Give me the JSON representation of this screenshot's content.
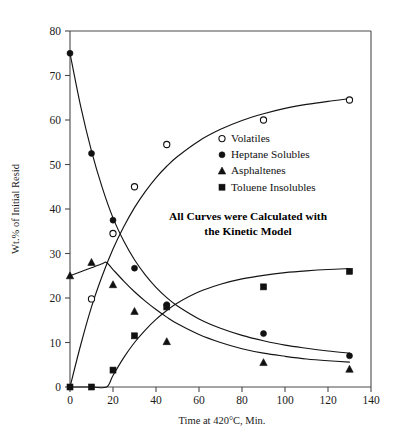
{
  "chart_data": {
    "type": "scatter",
    "title": "",
    "subtitle": "",
    "xlabel": "Time at 420°C, Min.",
    "ylabel": "Wt.% of Initial Resid",
    "xlim": [
      0,
      140
    ],
    "ylim": [
      0,
      80
    ],
    "xticks": [
      0,
      20,
      40,
      60,
      80,
      100,
      120,
      140
    ],
    "yticks": [
      0,
      10,
      20,
      30,
      40,
      50,
      60,
      70,
      80
    ],
    "grid": false,
    "legend_position": "upper-right-inside",
    "annotations": [
      {
        "line1": "All Curves were Calculated with",
        "line2": "the Kinetic Model"
      }
    ],
    "series": [
      {
        "name": "Volatiles",
        "marker": "open-circle",
        "x": [
          10,
          20,
          30,
          45,
          90,
          130
        ],
        "y": [
          19.8,
          34.5,
          45.0,
          54.5,
          60.0,
          64.5
        ],
        "fit_curve": {
          "x": [
            0,
            5,
            10,
            15,
            20,
            25,
            30,
            35,
            40,
            45,
            50,
            60,
            70,
            80,
            90,
            100,
            110,
            120,
            130
          ],
          "y": [
            0.0,
            9.5,
            18.0,
            25.0,
            31.0,
            36.0,
            40.3,
            43.9,
            47.0,
            49.6,
            51.8,
            55.3,
            57.9,
            59.9,
            61.4,
            62.6,
            63.5,
            64.2,
            64.8
          ]
        }
      },
      {
        "name": "Heptane Solubles",
        "marker": "filled-circle",
        "x": [
          0,
          10,
          20,
          30,
          45,
          90,
          130
        ],
        "y": [
          75.0,
          52.5,
          37.5,
          26.7,
          18.5,
          12.0,
          7.0
        ],
        "fit_curve": {
          "x": [
            0,
            5,
            10,
            15,
            20,
            25,
            30,
            35,
            40,
            45,
            50,
            60,
            70,
            80,
            90,
            100,
            110,
            120,
            130
          ],
          "y": [
            75.0,
            63.0,
            53.0,
            44.8,
            38.0,
            32.8,
            28.6,
            25.2,
            22.4,
            20.1,
            18.2,
            15.3,
            13.2,
            11.6,
            10.4,
            9.4,
            8.7,
            8.1,
            7.6
          ]
        }
      },
      {
        "name": "Asphaltenes",
        "marker": "filled-triangle",
        "x": [
          0,
          10,
          20,
          30,
          45,
          90,
          130
        ],
        "y": [
          25.0,
          28.0,
          23.0,
          17.0,
          10.2,
          5.5,
          4.0
        ],
        "fit_curve": {
          "x": [
            0,
            5,
            10,
            15,
            17,
            20,
            25,
            30,
            35,
            40,
            45,
            50,
            60,
            70,
            80,
            90,
            100,
            110,
            120,
            130
          ],
          "y": [
            25.0,
            25.9,
            26.8,
            27.7,
            28.0,
            26.4,
            23.8,
            21.4,
            19.3,
            17.4,
            15.7,
            14.2,
            11.8,
            10.0,
            8.6,
            7.6,
            6.9,
            6.3,
            5.9,
            5.6
          ]
        }
      },
      {
        "name": "Toluene Insolubles",
        "marker": "filled-square",
        "x": [
          0,
          10,
          20,
          30,
          45,
          90,
          130
        ],
        "y": [
          0.0,
          0.0,
          3.8,
          11.5,
          18.0,
          22.5,
          26.0
        ],
        "fit_curve": {
          "x": [
            0,
            10,
            17,
            20,
            25,
            30,
            35,
            40,
            45,
            50,
            60,
            70,
            80,
            90,
            100,
            110,
            120,
            130
          ],
          "y": [
            0.0,
            0.0,
            0.0,
            2.6,
            6.6,
            10.0,
            12.8,
            15.2,
            17.2,
            18.9,
            21.4,
            23.1,
            24.3,
            25.1,
            25.7,
            26.1,
            26.4,
            26.6
          ]
        }
      }
    ]
  },
  "axes": {
    "x_title": "Time at 420°C, Min.",
    "y_title": "Wt.% of Initial Resid",
    "x_tick_labels": [
      "0",
      "20",
      "40",
      "60",
      "80",
      "100",
      "120",
      "140"
    ],
    "y_tick_labels": [
      "0",
      "10",
      "20",
      "30",
      "40",
      "50",
      "60",
      "70",
      "80"
    ]
  },
  "legend": {
    "items": [
      {
        "label": "Volatiles",
        "marker": "open-circle"
      },
      {
        "label": "Heptane Solubles",
        "marker": "filled-circle"
      },
      {
        "label": "Asphaltenes",
        "marker": "filled-triangle"
      },
      {
        "label": "Toluene Insolubles",
        "marker": "filled-square"
      }
    ]
  },
  "annotation": {
    "line1": "All Curves were Calculated with",
    "line2": "the Kinetic Model"
  },
  "colors": {
    "ink": "#111111",
    "axis": "#4a4a4a",
    "background": "#ffffff"
  }
}
